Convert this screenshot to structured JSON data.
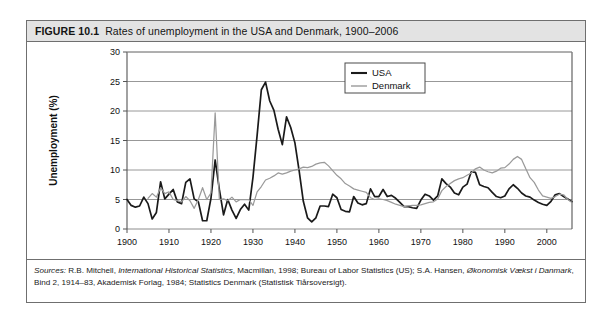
{
  "figure": {
    "number": "FIGURE 10.1",
    "caption": "Rates of unemployment in the USA and Denmark, 1900–2006"
  },
  "sources": {
    "lead": "Sources:",
    "line1_a": " R.B. Mitchell, ",
    "line1_italic": "International Historical Statistics",
    "line1_b": ", Macmillan, 1998; Bureau of Labor Statistics (US); S.A. Hansen, ",
    "line1_italic2": "Økonomisk Vækst i Danmark",
    "line1_c": ",",
    "line2": "Bind 2, 1914–83, Akademisk Forlag, 1984; Statistics Denmark (Statistisk Tiårsoversigt)."
  },
  "colors": {
    "usa": "#1a1a1a",
    "denmark": "#9a9a9a",
    "grid": "#8c8c8c",
    "axis": "#555555",
    "caption_bg": "#e3e3e3",
    "border": "#6f6f6f"
  },
  "chart_data": {
    "type": "line",
    "title": "Rates of unemployment in the USA and Denmark, 1900–2006",
    "xlabel": "",
    "ylabel": "Unemployment (%)",
    "xlim": [
      1900,
      2006
    ],
    "ylim": [
      0,
      30
    ],
    "yticks": [
      0,
      5,
      10,
      15,
      20,
      25,
      30
    ],
    "xticks": [
      1900,
      1910,
      1920,
      1930,
      1940,
      1950,
      1960,
      1970,
      1980,
      1990,
      2000
    ],
    "grid": "horizontal",
    "legend_position": "top-right",
    "legend": [
      "USA",
      "Denmark"
    ],
    "x": [
      1900,
      1901,
      1902,
      1903,
      1904,
      1905,
      1906,
      1907,
      1908,
      1909,
      1910,
      1911,
      1912,
      1913,
      1914,
      1915,
      1916,
      1917,
      1918,
      1919,
      1920,
      1921,
      1922,
      1923,
      1924,
      1925,
      1926,
      1927,
      1928,
      1929,
      1930,
      1931,
      1932,
      1933,
      1934,
      1935,
      1936,
      1937,
      1938,
      1939,
      1940,
      1941,
      1942,
      1943,
      1944,
      1945,
      1946,
      1947,
      1948,
      1949,
      1950,
      1951,
      1952,
      1953,
      1954,
      1955,
      1956,
      1957,
      1958,
      1959,
      1960,
      1961,
      1962,
      1963,
      1964,
      1965,
      1966,
      1967,
      1968,
      1969,
      1970,
      1971,
      1972,
      1973,
      1974,
      1975,
      1976,
      1977,
      1978,
      1979,
      1980,
      1981,
      1982,
      1983,
      1984,
      1985,
      1986,
      1987,
      1988,
      1989,
      1990,
      1991,
      1992,
      1993,
      1994,
      1995,
      1996,
      1997,
      1998,
      1999,
      2000,
      2001,
      2002,
      2003,
      2004,
      2005,
      2006
    ],
    "series": [
      {
        "name": "USA",
        "color": "#1a1a1a",
        "values": [
          5.0,
          4.0,
          3.7,
          3.9,
          5.4,
          4.3,
          1.7,
          2.8,
          8.0,
          5.1,
          5.9,
          6.7,
          4.6,
          4.3,
          7.9,
          8.5,
          5.1,
          4.6,
          1.4,
          1.4,
          5.2,
          11.7,
          6.7,
          2.4,
          5.0,
          3.2,
          1.8,
          3.3,
          4.2,
          3.2,
          8.7,
          15.9,
          23.6,
          24.9,
          21.7,
          20.1,
          16.9,
          14.3,
          19.0,
          17.2,
          14.6,
          9.9,
          4.7,
          1.9,
          1.2,
          1.9,
          3.9,
          3.9,
          3.8,
          5.9,
          5.3,
          3.3,
          3.0,
          2.9,
          5.5,
          4.4,
          4.1,
          4.3,
          6.8,
          5.5,
          5.5,
          6.7,
          5.5,
          5.7,
          5.2,
          4.5,
          3.8,
          3.8,
          3.6,
          3.5,
          4.9,
          5.9,
          5.6,
          4.9,
          5.6,
          8.5,
          7.7,
          7.1,
          6.1,
          5.8,
          7.1,
          7.6,
          9.7,
          9.6,
          7.5,
          7.2,
          7.0,
          6.2,
          5.5,
          5.3,
          5.6,
          6.8,
          7.5,
          6.9,
          6.1,
          5.6,
          5.4,
          4.9,
          4.5,
          4.2,
          4.0,
          4.7,
          5.8,
          6.0,
          5.5,
          5.1,
          4.6
        ]
      },
      {
        "name": "Denmark",
        "color": "#9a9a9a",
        "values": [
          null,
          null,
          null,
          null,
          null,
          5.2,
          6.0,
          5.4,
          7.0,
          6.0,
          6.3,
          5.0,
          4.8,
          4.6,
          5.5,
          4.8,
          3.5,
          5.0,
          7.0,
          5.0,
          6.1,
          19.7,
          5.0,
          5.1,
          4.8,
          5.4,
          4.6,
          5.0,
          5.0,
          5.0,
          4.0,
          6.3,
          7.2,
          8.3,
          8.6,
          9.0,
          9.5,
          9.3,
          9.5,
          9.8,
          10.0,
          10.2,
          10.5,
          10.4,
          10.6,
          11.0,
          11.2,
          11.3,
          10.7,
          9.9,
          9.1,
          8.5,
          7.7,
          7.3,
          6.8,
          6.6,
          6.4,
          6.2,
          5.3,
          5.0,
          5.1,
          5.0,
          4.8,
          4.5,
          4.2,
          4.0,
          3.8,
          3.9,
          4.0,
          4.0,
          4.1,
          4.3,
          4.5,
          4.6,
          5.1,
          6.5,
          7.2,
          7.7,
          8.2,
          8.5,
          8.7,
          9.1,
          9.5,
          10.2,
          10.5,
          10.0,
          9.7,
          9.5,
          9.8,
          10.3,
          10.4,
          11.0,
          11.8,
          12.3,
          11.8,
          10.2,
          8.7,
          7.9,
          6.6,
          5.6,
          5.4,
          5.2,
          5.5,
          5.9,
          5.8,
          5.0,
          4.5
        ]
      }
    ],
    "annotations": {
      "usa_peak": {
        "year": 1933,
        "value": 24.9
      },
      "denmark_peak": {
        "year": 1921,
        "value": 19.7
      },
      "denmark_modern_peak": {
        "year": 1993,
        "value": 12.3
      }
    }
  }
}
